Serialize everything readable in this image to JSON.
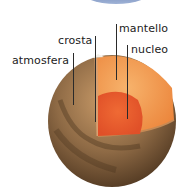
{
  "diagram": {
    "labels": {
      "mantle": "mantello",
      "crust": "crosta",
      "core": "nucleo",
      "atmosphere": "atmosfera"
    },
    "colors": {
      "surface": "#8a6a45",
      "surface_dark": "#5a4128",
      "mantle": "#f08a3a",
      "mantle_light": "#f6b06a",
      "core": "#e8552a",
      "top_arc": "#7b93c2"
    }
  }
}
